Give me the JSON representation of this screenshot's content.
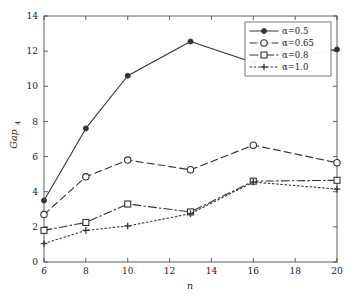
{
  "chart_data": {
    "type": "line",
    "title": "",
    "subtitle": "",
    "xlabel": "n",
    "ylabel": "Gap",
    "ylabel_subscript": "4",
    "x": [
      6,
      8,
      10,
      13,
      16,
      20
    ],
    "xlim": [
      6,
      20
    ],
    "ylim": [
      0,
      14
    ],
    "xticks": [
      6,
      8,
      10,
      12,
      14,
      16,
      18,
      20
    ],
    "yticks": [
      0,
      2,
      4,
      6,
      8,
      10,
      12,
      14
    ],
    "xtick_labels": [
      "6",
      "8",
      "10",
      "12",
      "14",
      "16",
      "18",
      "20"
    ],
    "ytick_labels": [
      "0",
      "2",
      "4",
      "6",
      "8",
      "10",
      "12",
      "14"
    ],
    "grid": false,
    "legend_position": "top-right",
    "series": [
      {
        "name": "α=0.5",
        "values": [
          3.5,
          7.6,
          10.6,
          12.55,
          11.35,
          12.1
        ],
        "line_style": "solid",
        "marker": "filled-circle",
        "color": "#333333"
      },
      {
        "name": "α=0.65",
        "values": [
          2.7,
          4.85,
          5.8,
          5.25,
          6.65,
          5.65
        ],
        "line_style": "dashed",
        "marker": "open-circle",
        "color": "#333333"
      },
      {
        "name": "α=0.8",
        "values": [
          1.8,
          2.25,
          3.3,
          2.85,
          4.6,
          4.65
        ],
        "line_style": "dash-dot",
        "marker": "open-square",
        "color": "#333333"
      },
      {
        "name": "α=1.0",
        "values": [
          1.05,
          1.8,
          2.05,
          2.75,
          4.55,
          4.15
        ],
        "line_style": "dotted",
        "marker": "plus",
        "color": "#333333"
      }
    ]
  }
}
